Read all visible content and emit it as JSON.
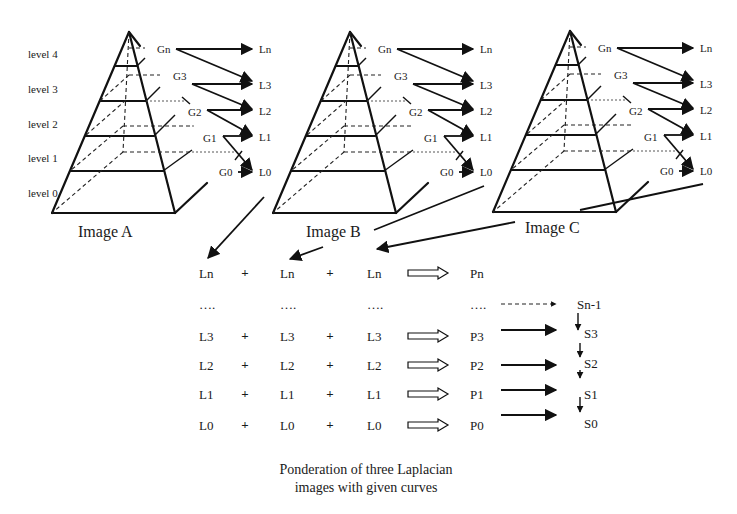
{
  "levels": [
    "level 4",
    "level 3",
    "level 2",
    "level 1",
    "level 0"
  ],
  "pyramids": [
    {
      "name": "Image A",
      "gaussians": [
        "Gn",
        "G3",
        "G2",
        "G1",
        "G0"
      ],
      "laplacians": [
        "Ln",
        "L3",
        "L2",
        "L1",
        "L0"
      ]
    },
    {
      "name": "Image B",
      "gaussians": [
        "Gn",
        "G3",
        "G2",
        "G1",
        "G0"
      ],
      "laplacians": [
        "Ln",
        "L3",
        "L2",
        "L1",
        "L0"
      ]
    },
    {
      "name": "Image C",
      "gaussians": [
        "Gn",
        "G3",
        "G2",
        "G1",
        "G0"
      ],
      "laplacians": [
        "Ln",
        "L3",
        "L2",
        "L1",
        "L0"
      ]
    }
  ],
  "combination": {
    "rows": [
      {
        "a": "Ln",
        "b": "Ln",
        "c": "Ln",
        "p": "Pn",
        "op": "+",
        "arrow": true
      },
      {
        "a": "….",
        "b": "….",
        "c": "….",
        "p": "….",
        "op": "",
        "arrow": false
      },
      {
        "a": "L3",
        "b": "L3",
        "c": "L3",
        "p": "P3",
        "op": "+",
        "arrow": true
      },
      {
        "a": "L2",
        "b": "L2",
        "c": "L2",
        "p": "P2",
        "op": "+",
        "arrow": true
      },
      {
        "a": "L1",
        "b": "L1",
        "c": "L1",
        "p": "P1",
        "op": "+",
        "arrow": true
      },
      {
        "a": "L0",
        "b": "L0",
        "c": "L0",
        "p": "P0",
        "op": "+",
        "arrow": true
      }
    ],
    "sums": [
      "Sn-1",
      "S3",
      "S2",
      "S1",
      "S0"
    ]
  },
  "caption": {
    "line1": "Ponderation of three Laplacian",
    "line2": "images with given curves"
  }
}
